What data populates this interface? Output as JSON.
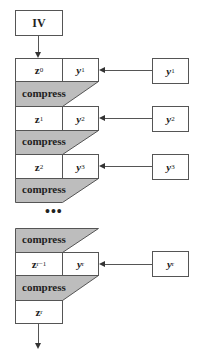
{
  "diagram": {
    "start": {
      "label": "IV"
    },
    "compress_label": "compress",
    "ellipsis": "•••",
    "rows": [
      {
        "z": "z",
        "z_sub": "0",
        "y": "y",
        "y_sub": "1",
        "input": "y",
        "input_sub": "1"
      },
      {
        "z": "z",
        "z_sub": "1",
        "y": "y",
        "y_sub": "2",
        "input": "y",
        "input_sub": "2"
      },
      {
        "z": "z",
        "z_sub": "2",
        "y": "y",
        "y_sub": "3",
        "input": "y",
        "input_sub": "3"
      },
      {
        "z": "z",
        "z_sub": "r−1",
        "y": "y",
        "y_sub": "r",
        "input": "y",
        "input_sub": "r"
      }
    ],
    "final": {
      "z": "z",
      "z_sub": "r"
    },
    "colors": {
      "compress_fill": "#bdbdbd",
      "stroke": "#555555"
    }
  }
}
